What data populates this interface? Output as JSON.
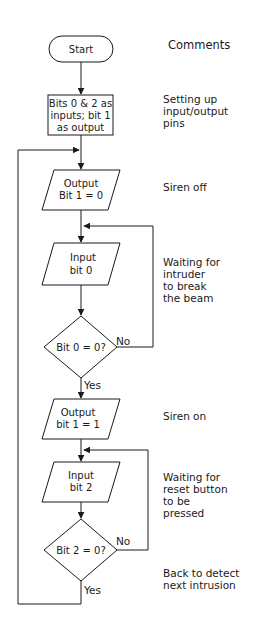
{
  "colors": {
    "stroke": "#1a1a1a",
    "background": "#ffffff",
    "text": "#1a1a1a"
  },
  "nodes": {
    "start": {
      "type": "terminator",
      "lines": [
        "Start"
      ]
    },
    "setup": {
      "type": "process",
      "lines": [
        "Bits 0 & 2 as",
        "inputs; bit 1",
        "as output"
      ]
    },
    "siren_off": {
      "type": "io",
      "lines": [
        "Output",
        "Bit 1 = 0"
      ]
    },
    "input_bit0": {
      "type": "io",
      "lines": [
        "Input",
        "bit 0"
      ]
    },
    "decision_bit0": {
      "type": "decision",
      "lines": [
        "Bit 0 = 0?"
      ]
    },
    "siren_on": {
      "type": "io",
      "lines": [
        "Output",
        "bit 1 = 1"
      ]
    },
    "input_bit2": {
      "type": "io",
      "lines": [
        "Input",
        "bit 2"
      ]
    },
    "decision_bit2": {
      "type": "decision",
      "lines": [
        "Bit 2 = 0?"
      ]
    }
  },
  "edge_labels": {
    "bit0_no": "No",
    "bit0_yes": "Yes",
    "bit2_no": "No",
    "bit2_yes": "Yes"
  },
  "comments": {
    "header": "Comments",
    "setup": "Setting up\ninput/output\npins",
    "siren_off": "Siren off",
    "wait_intruder": "Waiting for\nintruder\nto break\nthe beam",
    "siren_on": "Siren on",
    "wait_reset": "Waiting for\nreset button\nto be\npressed",
    "back": "Back to detect\nnext intrusion"
  }
}
